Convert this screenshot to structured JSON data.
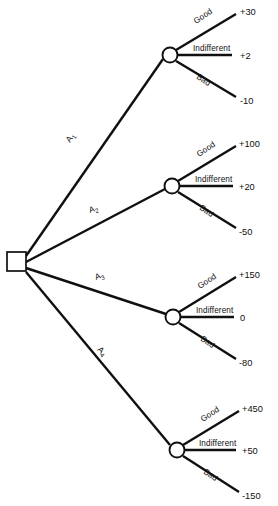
{
  "diagram": {
    "type": "decision-tree",
    "root_node": {
      "shape": "square",
      "kind": "decision-node",
      "x": 16,
      "y": 261
    },
    "alternatives": [
      {
        "id": "A1",
        "label": "A",
        "subscript": "1",
        "label_x": 70,
        "label_y": 143,
        "label_rotation": -57,
        "chance_node": {
          "x": 170,
          "y": 55,
          "r": 7.5
        },
        "outcomes": [
          {
            "state": "Good",
            "value": "+30",
            "label_x": 196,
            "label_y": 24,
            "label_rotation": -34,
            "end_x": 236,
            "end_y": 14,
            "value_x": 240,
            "value_y": 15
          },
          {
            "state": "Indifferent",
            "value": "+2",
            "label_x": 193,
            "label_y": 51,
            "label_rotation": 0,
            "end_x": 232,
            "end_y": 55,
            "value_x": 240,
            "value_y": 59
          },
          {
            "state": "Bad",
            "value": "-10",
            "label_x": 196,
            "label_y": 78,
            "label_rotation": 34,
            "end_x": 236,
            "end_y": 97,
            "value_x": 240,
            "value_y": 104
          }
        ]
      },
      {
        "id": "A2",
        "label": "A",
        "subscript": "2",
        "label_x": 90,
        "label_y": 213,
        "label_rotation": -19,
        "chance_node": {
          "x": 172,
          "y": 186,
          "r": 7.5
        },
        "outcomes": [
          {
            "state": "Good",
            "value": "+100",
            "label_x": 199,
            "label_y": 157,
            "label_rotation": -34,
            "end_x": 236,
            "end_y": 146,
            "value_x": 239,
            "value_y": 147
          },
          {
            "state": "Indifferent",
            "value": "+20",
            "label_x": 195,
            "label_y": 182,
            "label_rotation": 0,
            "end_x": 233,
            "end_y": 186,
            "value_x": 239,
            "value_y": 190
          },
          {
            "state": "Bad",
            "value": "-50",
            "label_x": 199,
            "label_y": 209,
            "label_rotation": 34,
            "end_x": 236,
            "end_y": 228,
            "value_x": 239,
            "value_y": 235
          }
        ]
      },
      {
        "id": "A3",
        "label": "A",
        "subscript": "3",
        "label_x": 96,
        "label_y": 280,
        "label_rotation": -20,
        "chance_node": {
          "x": 173,
          "y": 317,
          "r": 7.5
        },
        "outcomes": [
          {
            "state": "Good",
            "value": "+150",
            "label_x": 200,
            "label_y": 289,
            "label_rotation": -34,
            "end_x": 236,
            "end_y": 277,
            "value_x": 239,
            "value_y": 278
          },
          {
            "state": "Indifferent",
            "value": "0",
            "label_x": 196,
            "label_y": 313,
            "label_rotation": 0,
            "end_x": 234,
            "end_y": 317,
            "value_x": 240,
            "value_y": 321
          },
          {
            "state": "Bad",
            "value": "-80",
            "label_x": 200,
            "label_y": 340,
            "label_rotation": 34,
            "end_x": 236,
            "end_y": 359,
            "value_x": 239,
            "value_y": 366
          }
        ]
      },
      {
        "id": "A4",
        "label": "A",
        "subscript": "4",
        "label_x": 97,
        "label_y": 350,
        "label_rotation": 45,
        "chance_node": {
          "x": 177,
          "y": 450,
          "r": 7.5
        },
        "outcomes": [
          {
            "state": "Good",
            "value": "+450",
            "label_x": 203,
            "label_y": 422,
            "label_rotation": -34,
            "end_x": 239,
            "end_y": 411,
            "value_x": 242,
            "value_y": 412
          },
          {
            "state": "Indifferent",
            "value": "+50",
            "label_x": 199,
            "label_y": 446,
            "label_rotation": 0,
            "end_x": 236,
            "end_y": 450,
            "value_x": 242,
            "value_y": 454
          },
          {
            "state": "Bad",
            "value": "-150",
            "label_x": 203,
            "label_y": 473,
            "label_rotation": 34,
            "end_x": 239,
            "end_y": 492,
            "value_x": 242,
            "value_y": 499
          }
        ]
      }
    ],
    "colors": {
      "line": "#101010",
      "background": "#ffffff",
      "node_fill": "#ffffff"
    }
  }
}
